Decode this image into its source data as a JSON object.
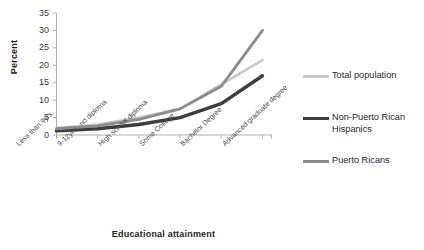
{
  "chart_data": {
    "type": "line",
    "title": "",
    "xlabel": "Educational attainment",
    "ylabel": "Percent",
    "categories": [
      "Less than 9yrs.",
      "9-12yrs., no diploma",
      "High school diploma",
      "Some College",
      "Bachelor Degree",
      "Advanced graduate degree"
    ],
    "ylim": [
      0,
      35
    ],
    "yticks": [
      0,
      5,
      10,
      15,
      20,
      25,
      30,
      35
    ],
    "grid": false,
    "legend_position": "right",
    "series": [
      {
        "name": "Total population",
        "color": "#c9c9c9",
        "width": 2.6,
        "values": [
          2.0,
          3.0,
          5.0,
          7.5,
          14.5,
          21.5
        ]
      },
      {
        "name": "Non-Puerto Rican Hispanics",
        "color": "#3d3d3d",
        "width": 3.4,
        "values": [
          1.2,
          1.8,
          3.0,
          5.0,
          9.0,
          17.0
        ]
      },
      {
        "name": "Puerto Ricans",
        "color": "#8c8c8c",
        "width": 2.8,
        "values": [
          1.8,
          2.6,
          4.5,
          7.5,
          14.0,
          30.0
        ]
      }
    ]
  },
  "legend": {
    "items": [
      {
        "label": "Total population"
      },
      {
        "label": "Non-Puerto Rican Hispanics"
      },
      {
        "label": "Puerto Ricans"
      }
    ]
  },
  "axes": {
    "y_title": "Percent",
    "x_title": "Educational attainment",
    "y_tick_labels": [
      "35",
      "30",
      "25",
      "20",
      "15",
      "10",
      "5",
      "0"
    ],
    "x_tick_labels": [
      "Less than 9yrs.",
      "9-12yrs., no diploma",
      "High school diploma",
      "Some College",
      "Bachelor Degree",
      "Advanced graduate degree"
    ]
  },
  "colors": {
    "total_population": "#c9c9c9",
    "non_puerto_rican_hispanics": "#3d3d3d",
    "puerto_ricans": "#8c8c8c",
    "axis": "#b0b0b0",
    "text": "#1f1f1f"
  }
}
